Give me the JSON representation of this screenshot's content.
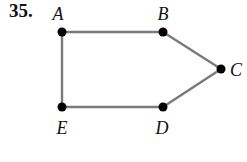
{
  "problem": {
    "number": "35."
  },
  "graph": {
    "nodes": [
      {
        "id": "A",
        "label": "A",
        "x": 62,
        "y": 32,
        "label_x": 58,
        "label_y": 20,
        "anchor": "middle"
      },
      {
        "id": "B",
        "label": "B",
        "x": 163,
        "y": 32,
        "label_x": 163,
        "label_y": 20,
        "anchor": "middle"
      },
      {
        "id": "C",
        "label": "C",
        "x": 221,
        "y": 69,
        "label_x": 230,
        "label_y": 76,
        "anchor": "start"
      },
      {
        "id": "D",
        "label": "D",
        "x": 163,
        "y": 107,
        "label_x": 162,
        "label_y": 134,
        "anchor": "middle"
      },
      {
        "id": "E",
        "label": "E",
        "x": 62,
        "y": 107,
        "label_x": 62,
        "label_y": 134,
        "anchor": "middle"
      }
    ],
    "edges": [
      [
        "A",
        "B"
      ],
      [
        "B",
        "C"
      ],
      [
        "C",
        "D"
      ],
      [
        "D",
        "E"
      ],
      [
        "E",
        "A"
      ]
    ],
    "colors": {
      "edge": "#7a7a7a",
      "node": "#000000",
      "text": "#111111"
    }
  }
}
